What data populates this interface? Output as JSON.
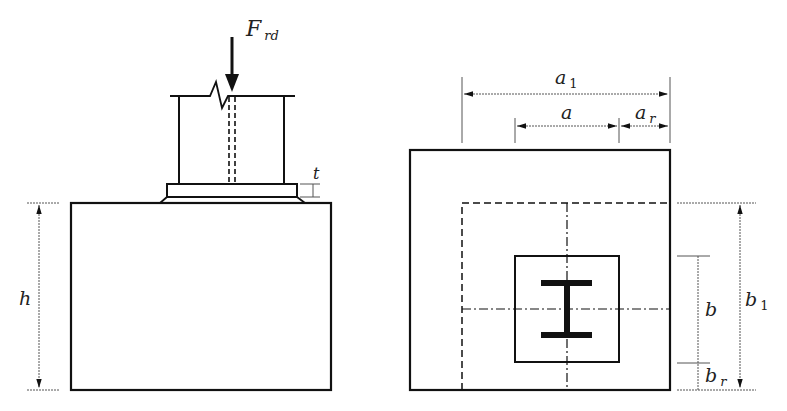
{
  "diagram": {
    "colors": {
      "stroke": "#111111",
      "dim": "#555555",
      "background": "#ffffff"
    },
    "labels": {
      "force": {
        "main": "F",
        "sub": "rd"
      },
      "thickness": "t",
      "height": "h",
      "a1": {
        "main": "a",
        "sub": "1"
      },
      "a": "a",
      "ar": {
        "main": "a",
        "sub": "r"
      },
      "b": "b",
      "b1": {
        "main": "b",
        "sub": "1"
      },
      "br": {
        "main": "b",
        "sub": "r"
      }
    },
    "views": [
      {
        "name": "elevation",
        "description": "Side view: column, base plate of thickness t, grout, foundation of height h"
      },
      {
        "name": "plan",
        "description": "Plan view: foundation a1 x b1, base plate a x b, I-section column, edge distances ar and br"
      }
    ]
  }
}
